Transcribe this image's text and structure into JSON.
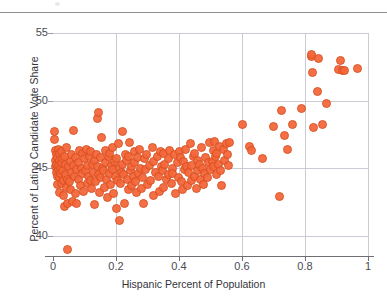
{
  "chart_data": {
    "type": "scatter",
    "title": "",
    "xlabel": "Hispanic Percent of Population",
    "ylabel": "Percent of Latino Candidate Vote Share",
    "xlim": [
      0,
      1
    ],
    "ylim": [
      38.5,
      55
    ],
    "xticks": [
      "0",
      "0.2",
      "0.4",
      "0.6",
      "0.8",
      "1"
    ],
    "xtick_values": [
      0,
      0.2,
      0.4,
      0.6,
      0.8,
      1
    ],
    "yticks": [
      "55",
      "50",
      "45",
      "40"
    ],
    "ytick_values": [
      55,
      50,
      45,
      40
    ],
    "grid": true,
    "grid_color": "#c9ccd4",
    "legend": null,
    "marker_color": "#f4673a",
    "marker_edge_color": "#d8501f",
    "series": [
      {
        "name": "Districts",
        "points": [
          [
            0.004,
            47.7
          ],
          [
            0.006,
            47.1
          ],
          [
            0.007,
            46.3
          ],
          [
            0.008,
            45.6
          ],
          [
            0.009,
            45.1
          ],
          [
            0.01,
            44.7
          ],
          [
            0.011,
            46.0
          ],
          [
            0.012,
            45.3
          ],
          [
            0.013,
            44.4
          ],
          [
            0.014,
            43.8
          ],
          [
            0.015,
            45.8
          ],
          [
            0.016,
            44.9
          ],
          [
            0.017,
            46.4
          ],
          [
            0.018,
            45.2
          ],
          [
            0.019,
            43.2
          ],
          [
            0.02,
            45.6
          ],
          [
            0.021,
            44.3
          ],
          [
            0.022,
            46.1
          ],
          [
            0.023,
            45.0
          ],
          [
            0.024,
            44.6
          ],
          [
            0.026,
            45.4
          ],
          [
            0.027,
            43.9
          ],
          [
            0.028,
            46.2
          ],
          [
            0.03,
            44.8
          ],
          [
            0.031,
            45.7
          ],
          [
            0.033,
            44.1
          ],
          [
            0.034,
            43.0
          ],
          [
            0.035,
            45.9
          ],
          [
            0.036,
            42.2
          ],
          [
            0.038,
            44.5
          ],
          [
            0.04,
            45.3
          ],
          [
            0.042,
            43.6
          ],
          [
            0.043,
            46.5
          ],
          [
            0.045,
            44.2
          ],
          [
            0.046,
            42.4
          ],
          [
            0.047,
            39.0
          ],
          [
            0.05,
            45.1
          ],
          [
            0.052,
            44.0
          ],
          [
            0.054,
            45.5
          ],
          [
            0.056,
            43.4
          ],
          [
            0.058,
            46.0
          ],
          [
            0.06,
            44.7
          ],
          [
            0.062,
            42.5
          ],
          [
            0.064,
            45.2
          ],
          [
            0.066,
            47.8
          ],
          [
            0.068,
            44.4
          ],
          [
            0.07,
            43.1
          ],
          [
            0.072,
            45.8
          ],
          [
            0.074,
            44.9
          ],
          [
            0.076,
            42.4
          ],
          [
            0.08,
            45.4
          ],
          [
            0.082,
            44.2
          ],
          [
            0.085,
            46.3
          ],
          [
            0.087,
            43.7
          ],
          [
            0.09,
            45.0
          ],
          [
            0.092,
            44.6
          ],
          [
            0.095,
            46.1
          ],
          [
            0.098,
            43.3
          ],
          [
            0.1,
            45.7
          ],
          [
            0.102,
            44.8
          ],
          [
            0.105,
            46.4
          ],
          [
            0.108,
            45.2
          ],
          [
            0.11,
            43.9
          ],
          [
            0.112,
            44.4
          ],
          [
            0.115,
            45.9
          ],
          [
            0.118,
            44.1
          ],
          [
            0.12,
            46.2
          ],
          [
            0.122,
            43.5
          ],
          [
            0.125,
            45.3
          ],
          [
            0.128,
            44.7
          ],
          [
            0.13,
            42.3
          ],
          [
            0.132,
            45.6
          ],
          [
            0.135,
            44.0
          ],
          [
            0.138,
            46.0
          ],
          [
            0.14,
            45.1
          ],
          [
            0.142,
            48.7
          ],
          [
            0.143,
            49.1
          ],
          [
            0.145,
            44.5
          ],
          [
            0.148,
            43.2
          ],
          [
            0.15,
            45.8
          ],
          [
            0.152,
            44.3
          ],
          [
            0.155,
            47.3
          ],
          [
            0.158,
            45.0
          ],
          [
            0.16,
            44.8
          ],
          [
            0.162,
            43.6
          ],
          [
            0.165,
            46.3
          ],
          [
            0.168,
            45.4
          ],
          [
            0.17,
            44.2
          ],
          [
            0.172,
            42.8
          ],
          [
            0.175,
            45.9
          ],
          [
            0.178,
            44.6
          ],
          [
            0.18,
            46.1
          ],
          [
            0.182,
            43.8
          ],
          [
            0.185,
            45.2
          ],
          [
            0.188,
            44.9
          ],
          [
            0.19,
            46.5
          ],
          [
            0.192,
            43.1
          ],
          [
            0.195,
            45.5
          ],
          [
            0.198,
            44.4
          ],
          [
            0.2,
            42.0
          ],
          [
            0.202,
            45.7
          ],
          [
            0.205,
            44.1
          ],
          [
            0.208,
            46.8
          ],
          [
            0.21,
            41.1
          ],
          [
            0.212,
            45.0
          ],
          [
            0.215,
            43.9
          ],
          [
            0.218,
            44.7
          ],
          [
            0.22,
            47.7
          ],
          [
            0.222,
            45.3
          ],
          [
            0.225,
            44.5
          ],
          [
            0.228,
            42.4
          ],
          [
            0.23,
            46.0
          ],
          [
            0.232,
            45.6
          ],
          [
            0.235,
            44.2
          ],
          [
            0.238,
            43.4
          ],
          [
            0.24,
            45.9
          ],
          [
            0.242,
            46.9
          ],
          [
            0.245,
            44.8
          ],
          [
            0.248,
            45.1
          ],
          [
            0.25,
            43.7
          ],
          [
            0.255,
            44.4
          ],
          [
            0.258,
            46.2
          ],
          [
            0.26,
            45.4
          ],
          [
            0.262,
            44.0
          ],
          [
            0.265,
            43.2
          ],
          [
            0.268,
            45.8
          ],
          [
            0.27,
            44.6
          ],
          [
            0.275,
            46.4
          ],
          [
            0.278,
            45.0
          ],
          [
            0.28,
            43.5
          ],
          [
            0.285,
            44.3
          ],
          [
            0.288,
            42.4
          ],
          [
            0.29,
            45.7
          ],
          [
            0.295,
            44.9
          ],
          [
            0.298,
            46.0
          ],
          [
            0.3,
            43.8
          ],
          [
            0.305,
            45.2
          ],
          [
            0.31,
            44.1
          ],
          [
            0.315,
            46.5
          ],
          [
            0.318,
            45.5
          ],
          [
            0.32,
            43.0
          ],
          [
            0.325,
            44.7
          ],
          [
            0.33,
            45.9
          ],
          [
            0.335,
            44.4
          ],
          [
            0.338,
            43.3
          ],
          [
            0.34,
            46.2
          ],
          [
            0.345,
            45.1
          ],
          [
            0.348,
            44.8
          ],
          [
            0.35,
            46.1
          ],
          [
            0.352,
            43.6
          ],
          [
            0.355,
            45.3
          ],
          [
            0.36,
            44.2
          ],
          [
            0.365,
            45.7
          ],
          [
            0.368,
            44.5
          ],
          [
            0.37,
            46.3
          ],
          [
            0.375,
            43.9
          ],
          [
            0.378,
            45.0
          ],
          [
            0.38,
            44.6
          ],
          [
            0.385,
            46.0
          ],
          [
            0.39,
            43.1
          ],
          [
            0.395,
            45.4
          ],
          [
            0.398,
            44.3
          ],
          [
            0.4,
            46.2
          ],
          [
            0.405,
            45.8
          ],
          [
            0.408,
            44.0
          ],
          [
            0.41,
            43.4
          ],
          [
            0.415,
            45.5
          ],
          [
            0.418,
            44.9
          ],
          [
            0.42,
            46.4
          ],
          [
            0.425,
            45.1
          ],
          [
            0.428,
            43.7
          ],
          [
            0.43,
            44.7
          ],
          [
            0.435,
            46.8
          ],
          [
            0.438,
            45.2
          ],
          [
            0.44,
            44.1
          ],
          [
            0.445,
            45.9
          ],
          [
            0.448,
            44.4
          ],
          [
            0.45,
            46.1
          ],
          [
            0.455,
            43.5
          ],
          [
            0.458,
            45.6
          ],
          [
            0.46,
            44.8
          ],
          [
            0.465,
            45.3
          ],
          [
            0.468,
            44.2
          ],
          [
            0.47,
            46.5
          ],
          [
            0.475,
            45.0
          ],
          [
            0.478,
            43.8
          ],
          [
            0.48,
            44.6
          ],
          [
            0.485,
            45.8
          ],
          [
            0.49,
            44.3
          ],
          [
            0.495,
            45.4
          ],
          [
            0.498,
            46.9
          ],
          [
            0.5,
            44.9
          ],
          [
            0.505,
            45.5
          ],
          [
            0.508,
            46.3
          ],
          [
            0.51,
            45.1
          ],
          [
            0.512,
            47.0
          ],
          [
            0.515,
            45.9
          ],
          [
            0.518,
            44.5
          ],
          [
            0.52,
            46.1
          ],
          [
            0.525,
            45.3
          ],
          [
            0.528,
            46.6
          ],
          [
            0.53,
            44.8
          ],
          [
            0.535,
            43.7
          ],
          [
            0.54,
            46.4
          ],
          [
            0.545,
            45.6
          ],
          [
            0.55,
            46.8
          ],
          [
            0.555,
            46.0
          ],
          [
            0.558,
            45.2
          ],
          [
            0.56,
            46.9
          ],
          [
            0.6,
            48.2
          ],
          [
            0.625,
            46.6
          ],
          [
            0.63,
            46.3
          ],
          [
            0.665,
            45.7
          ],
          [
            0.7,
            48.1
          ],
          [
            0.718,
            42.9
          ],
          [
            0.725,
            49.3
          ],
          [
            0.735,
            47.4
          ],
          [
            0.745,
            46.4
          ],
          [
            0.76,
            48.2
          ],
          [
            0.79,
            49.4
          ],
          [
            0.82,
            53.3
          ],
          [
            0.822,
            53.4
          ],
          [
            0.825,
            52.1
          ],
          [
            0.828,
            48.0
          ],
          [
            0.84,
            50.7
          ],
          [
            0.843,
            53.1
          ],
          [
            0.855,
            48.2
          ],
          [
            0.868,
            49.8
          ],
          [
            0.905,
            52.3
          ],
          [
            0.912,
            53.0
          ],
          [
            0.918,
            52.2
          ],
          [
            0.925,
            52.2
          ],
          [
            0.968,
            52.4
          ]
        ]
      }
    ]
  },
  "figure": {
    "top_rule": "",
    "background": "#ffffff"
  }
}
